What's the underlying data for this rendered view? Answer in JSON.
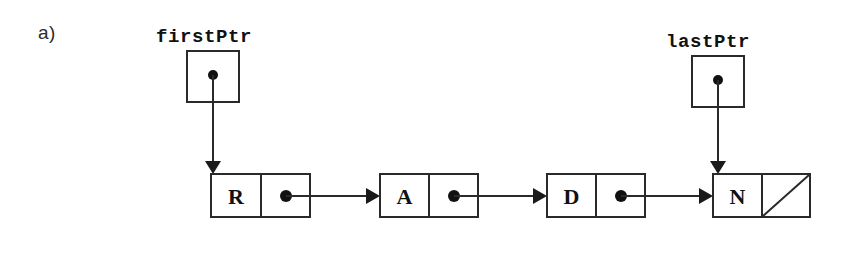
{
  "figure": {
    "part_label": "a)"
  },
  "pointers": [
    {
      "id": "firstPtr",
      "label": "firstPtr",
      "label_x": 156,
      "label_y": 26,
      "box": {
        "x": 187,
        "y": 51,
        "w": 52,
        "h": 51
      },
      "dot": {
        "cx": 213,
        "cy": 75,
        "r": 5
      },
      "arrow": {
        "x": 213,
        "y1": 75,
        "y2": 172
      },
      "target": "node-R"
    },
    {
      "id": "lastPtr",
      "label": "lastPtr",
      "label_x": 666,
      "label_y": 31,
      "box": {
        "x": 692,
        "y": 56,
        "w": 52,
        "h": 51
      },
      "dot": {
        "cx": 718,
        "cy": 80,
        "r": 5
      },
      "arrow": {
        "x": 718,
        "y1": 80,
        "y2": 172
      },
      "target": "node-N"
    }
  ],
  "nodes": [
    {
      "id": "node-R",
      "letter": "R",
      "box": {
        "x": 211,
        "y": 174,
        "w": 99,
        "h": 43
      },
      "divider_x": 261,
      "dot": {
        "cx": 286,
        "cy": 196,
        "r": 6
      },
      "link": {
        "x1": 286,
        "x2": 378,
        "y": 196
      },
      "next": "node-A",
      "null_link": false
    },
    {
      "id": "node-A",
      "letter": "A",
      "box": {
        "x": 380,
        "y": 174,
        "w": 98,
        "h": 43
      },
      "divider_x": 429,
      "dot": {
        "cx": 454,
        "cy": 196,
        "r": 6
      },
      "link": {
        "x1": 454,
        "x2": 546,
        "y": 196
      },
      "next": "node-D",
      "null_link": false
    },
    {
      "id": "node-D",
      "letter": "D",
      "box": {
        "x": 547,
        "y": 174,
        "w": 98,
        "h": 43
      },
      "divider_x": 596,
      "dot": {
        "cx": 621,
        "cy": 196,
        "r": 6
      },
      "link": {
        "x1": 621,
        "x2": 712,
        "y": 196
      },
      "next": "node-N",
      "null_link": false
    },
    {
      "id": "node-N",
      "letter": "N",
      "box": {
        "x": 713,
        "y": 174,
        "w": 97,
        "h": 43
      },
      "divider_x": 762,
      "dot": null,
      "link": null,
      "next": null,
      "null_link": true
    }
  ],
  "style": {
    "stroke_color": "#2a2a2a",
    "fill_color": "#ffffff",
    "dot_color": "#111111",
    "background": "#ffffff",
    "stroke_width": 2
  }
}
